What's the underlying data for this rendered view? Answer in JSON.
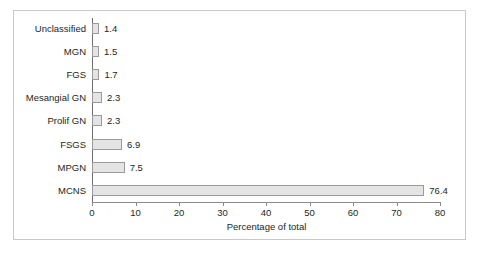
{
  "chart_data": {
    "type": "bar",
    "orientation": "horizontal",
    "title": "",
    "xlabel": "Percentage of total",
    "ylabel": "",
    "xlim": [
      0,
      80
    ],
    "xticks": [
      0,
      10,
      20,
      30,
      40,
      50,
      60,
      70,
      80
    ],
    "xtick_labels": [
      "0",
      "10",
      "20",
      "30",
      "40",
      "50",
      "60",
      "70",
      "80"
    ],
    "grid": false,
    "legend": null,
    "categories": [
      "Unclassified",
      "MGN",
      "FGS",
      "Mesangial GN",
      "Prolif GN",
      "FSGS",
      "MPGN",
      "MCNS"
    ],
    "values": [
      1.4,
      1.5,
      1.7,
      2.3,
      2.3,
      6.9,
      7.5,
      76.4
    ],
    "value_labels": [
      "1.4",
      "1.5",
      "1.7",
      "2.3",
      "2.3",
      "6.9",
      "7.5",
      "76.4"
    ],
    "colors": {
      "bar_fill": "#e4e4e4",
      "bar_border": "#9a9a9a",
      "axis": "#8a8a8a",
      "text": "#231f20",
      "frame": "#c9c9c9",
      "background": "#ffffff"
    }
  }
}
